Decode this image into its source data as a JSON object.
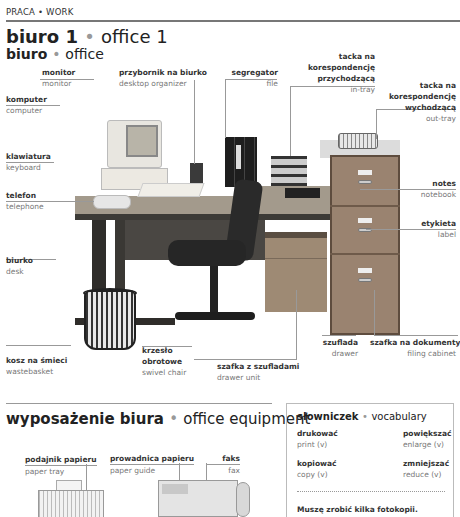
{
  "header": {
    "section": "PRACA • WORK",
    "title_pl": "biuro 1",
    "title_sep": "•",
    "title_en": "office 1",
    "subtitle_pl": "biuro",
    "subtitle_sep": "•",
    "subtitle_en": "office"
  },
  "labels": {
    "monitor": {
      "pl": "monitor",
      "en": "monitor"
    },
    "organizer": {
      "pl": "przybornik na biurko",
      "en": "desktop organizer"
    },
    "file": {
      "pl": "segregator",
      "en": "file"
    },
    "intray": {
      "pl1": "tacka na",
      "pl2": "korespondencję",
      "pl3": "przychodzącą",
      "en": "in-tray"
    },
    "outtray": {
      "pl1": "tacka na",
      "pl2": "korespondencję",
      "pl3": "wychodzącą",
      "en": "out-tray"
    },
    "computer": {
      "pl": "komputer",
      "en": "computer"
    },
    "keyboard": {
      "pl": "klawiatura",
      "en": "keyboard"
    },
    "telephone": {
      "pl": "telefon",
      "en": "telephone"
    },
    "notebook": {
      "pl": "notes",
      "en": "notebook"
    },
    "label": {
      "pl": "etykieta",
      "en": "label"
    },
    "desk": {
      "pl": "biurko",
      "en": "desk"
    },
    "wastebasket": {
      "pl": "kosz na śmieci",
      "en": "wastebasket"
    },
    "chair": {
      "pl1": "krzesło",
      "pl2": "obrotowe",
      "en": "swivel chair"
    },
    "drawer_unit": {
      "pl": "szafka z szufladami",
      "en": "drawer unit"
    },
    "drawer": {
      "pl": "szuflada",
      "en": "drawer"
    },
    "filing_cabinet": {
      "pl": "szafka na dokumenty",
      "en": "filing cabinet"
    }
  },
  "equipment": {
    "title_pl": "wyposażenie biura",
    "title_sep": "•",
    "title_en": "office equipment",
    "labels": {
      "paper_tray": {
        "pl": "podajnik papieru",
        "en": "paper tray"
      },
      "paper_guide": {
        "pl": "prowadnica papieru",
        "en": "paper guide"
      },
      "fax": {
        "pl": "faks",
        "en": "fax"
      }
    }
  },
  "vocabulary": {
    "title_pl": "słowniczek",
    "title_sep": "•",
    "title_en": "vocabulary",
    "items": [
      {
        "pl": "drukować",
        "en": "print (v)"
      },
      {
        "pl": "powiększać",
        "en": "enlarge (v)"
      },
      {
        "pl": "kopiować",
        "en": "copy (v)"
      },
      {
        "pl": "zmniejszać",
        "en": "reduce (v)"
      }
    ],
    "sentence": "Muszę zrobić kilka fotokopii."
  }
}
